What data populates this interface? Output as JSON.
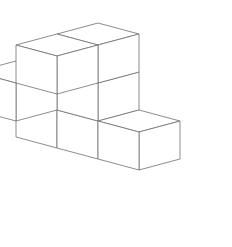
{
  "figure": {
    "kind": "isometric-polycube-line-drawing",
    "title": "",
    "background_color": "#ffffff",
    "line_color": "#6e6e6e",
    "line_width": 0.8,
    "canvas": {
      "width": 232,
      "height": 247
    },
    "projection": {
      "type": "isometric",
      "origin_x": 98,
      "origin_y": 99,
      "unit_x_dx": 41,
      "unit_x_dy": 11,
      "unit_y_dx": -41,
      "unit_y_dy": 11,
      "unit_z_dx": 0,
      "unit_z_dy": -38
    },
    "cube_count": 7,
    "cubes": [
      {
        "name": "top-cube",
        "i": 0,
        "j": 0,
        "k": 1
      },
      {
        "name": "center-cube",
        "i": 0,
        "j": 0,
        "k": 0
      },
      {
        "name": "left-upper-cube",
        "i": 0,
        "j": 1,
        "k": 1
      },
      {
        "name": "left-front-cube",
        "i": -1,
        "j": 1,
        "k": 0
      },
      {
        "name": "right-cube",
        "i": 1,
        "j": 0,
        "k": -1
      },
      {
        "name": "front-cube",
        "i": 0,
        "j": 0,
        "k": -1
      },
      {
        "name": "bottom-front-cube",
        "i": -1,
        "j": 0,
        "k": -1
      }
    ]
  }
}
